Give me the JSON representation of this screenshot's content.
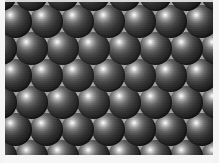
{
  "image": {
    "title": "Close-packed array of dark spheres",
    "subject": "monodisperse spherical particles in hexagonal close packing",
    "caption": "",
    "width_px": 219,
    "height_px": 163
  },
  "frame": {
    "left_band_label": "left margin",
    "right_band_label": "right margin",
    "bottom_band_label": "bottom margin",
    "top_band_label": "top margin",
    "band_color": "#f4f4f4"
  },
  "field": {
    "label": "sphere field",
    "background_color": "#9d9d9d",
    "interstitial_color": "#9d9d9d"
  },
  "spheres": {
    "label": "sphere",
    "diameter_px": 33,
    "column_pitch_px": 31,
    "row_pitch_px": 27,
    "row_offset_px": 15.5,
    "rows_visible": 7,
    "columns_visible": 7,
    "packing": "hexagonal close packed",
    "highlight_position": "upper-left",
    "highlight_color": "#ffffff",
    "shadow_color": "#0b0b0b",
    "midtone_color": "#434343"
  },
  "chart_data": {
    "type": "scatter",
    "xlabel": "",
    "ylabel": "",
    "lattice": "hexagonal",
    "sphere_diameter_px": 33,
    "nearest_neighbor_distance_px": 31,
    "row_spacing_px": 27,
    "centers": [
      [
        -5,
        -8
      ],
      [
        26,
        -8
      ],
      [
        57,
        -8
      ],
      [
        88,
        -8
      ],
      [
        119,
        -8
      ],
      [
        150,
        -8
      ],
      [
        181,
        -8
      ],
      [
        212,
        -8
      ],
      [
        10,
        19
      ],
      [
        41,
        19
      ],
      [
        72,
        19
      ],
      [
        103,
        19
      ],
      [
        134,
        19
      ],
      [
        165,
        19
      ],
      [
        196,
        19
      ],
      [
        -5,
        46
      ],
      [
        26,
        46
      ],
      [
        57,
        46
      ],
      [
        88,
        46
      ],
      [
        119,
        46
      ],
      [
        150,
        46
      ],
      [
        181,
        46
      ],
      [
        212,
        46
      ],
      [
        10,
        73
      ],
      [
        41,
        73
      ],
      [
        72,
        73
      ],
      [
        103,
        73
      ],
      [
        134,
        73
      ],
      [
        165,
        73
      ],
      [
        196,
        73
      ],
      [
        -5,
        100
      ],
      [
        26,
        100
      ],
      [
        57,
        100
      ],
      [
        88,
        100
      ],
      [
        119,
        100
      ],
      [
        150,
        100
      ],
      [
        181,
        100
      ],
      [
        212,
        100
      ],
      [
        10,
        127
      ],
      [
        41,
        127
      ],
      [
        72,
        127
      ],
      [
        103,
        127
      ],
      [
        134,
        127
      ],
      [
        165,
        127
      ],
      [
        196,
        127
      ],
      [
        -5,
        154
      ],
      [
        26,
        154
      ],
      [
        57,
        154
      ],
      [
        88,
        154
      ],
      [
        119,
        154
      ],
      [
        150,
        154
      ],
      [
        181,
        154
      ],
      [
        212,
        154
      ]
    ]
  }
}
